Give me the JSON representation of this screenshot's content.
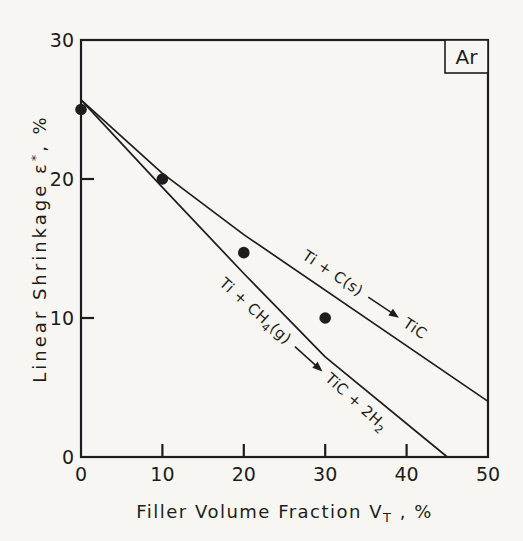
{
  "figure": {
    "background": "#f7f6f2",
    "ink": "#1d1d1b",
    "corner_label": "Ar"
  },
  "chart_data": {
    "type": "line",
    "title": "",
    "xlabel": "Filler Volume Fraction V_T , %",
    "ylabel": "Linear Shrinkage ε*, %",
    "xlabel_parts": [
      {
        "t": "Filler Volume Fraction V"
      },
      {
        "t": "T",
        "sub": true
      },
      {
        "t": " , %"
      }
    ],
    "ylabel_parts": [
      {
        "t": "Linear Shrinkage ε"
      },
      {
        "t": "*",
        "sup": true
      },
      {
        "t": ", %"
      }
    ],
    "xlim": [
      0,
      50
    ],
    "ylim": [
      0,
      30
    ],
    "x_ticks": [
      0,
      10,
      20,
      30,
      40,
      50
    ],
    "y_ticks": [
      0,
      10,
      20,
      30
    ],
    "grid": false,
    "legend_position": "none",
    "atmosphere_box_label": "Ar",
    "series": [
      {
        "name": "Ti + C(s) → TiC",
        "kind": "line",
        "points": [
          [
            0,
            25.7
          ],
          [
            10,
            20.4
          ],
          [
            20,
            16.0
          ],
          [
            50,
            4.0
          ]
        ]
      },
      {
        "name": "Ti + CH4(g) → TiC + 2H2",
        "kind": "line",
        "points": [
          [
            0,
            25.7
          ],
          [
            10,
            19.4
          ],
          [
            20,
            13.2
          ],
          [
            30,
            7.2
          ],
          [
            45,
            0
          ]
        ]
      },
      {
        "name": "experimental shrinkage points",
        "kind": "scatter",
        "points": [
          [
            0,
            25.0
          ],
          [
            10,
            20.0
          ],
          [
            20,
            14.7
          ],
          [
            30,
            10.0
          ]
        ]
      }
    ],
    "annotations": [
      {
        "id": "reaction-carbon-solid",
        "series": 0,
        "xy": [
          34.8,
          11.7
        ],
        "pre": [
          {
            "t": "Ti + C(s)"
          }
        ],
        "arrow": true,
        "post": [
          {
            "t": "TiC"
          }
        ]
      },
      {
        "id": "reaction-methane-gas",
        "series": 1,
        "xy": [
          27.3,
          7.4
        ],
        "pre": [
          {
            "t": "Ti + CH"
          },
          {
            "t": "4",
            "sub": true
          },
          {
            "t": "(g)"
          }
        ],
        "arrow": true,
        "post": [
          {
            "t": "TiC + 2H"
          },
          {
            "t": "2",
            "sub": true
          }
        ]
      }
    ]
  }
}
